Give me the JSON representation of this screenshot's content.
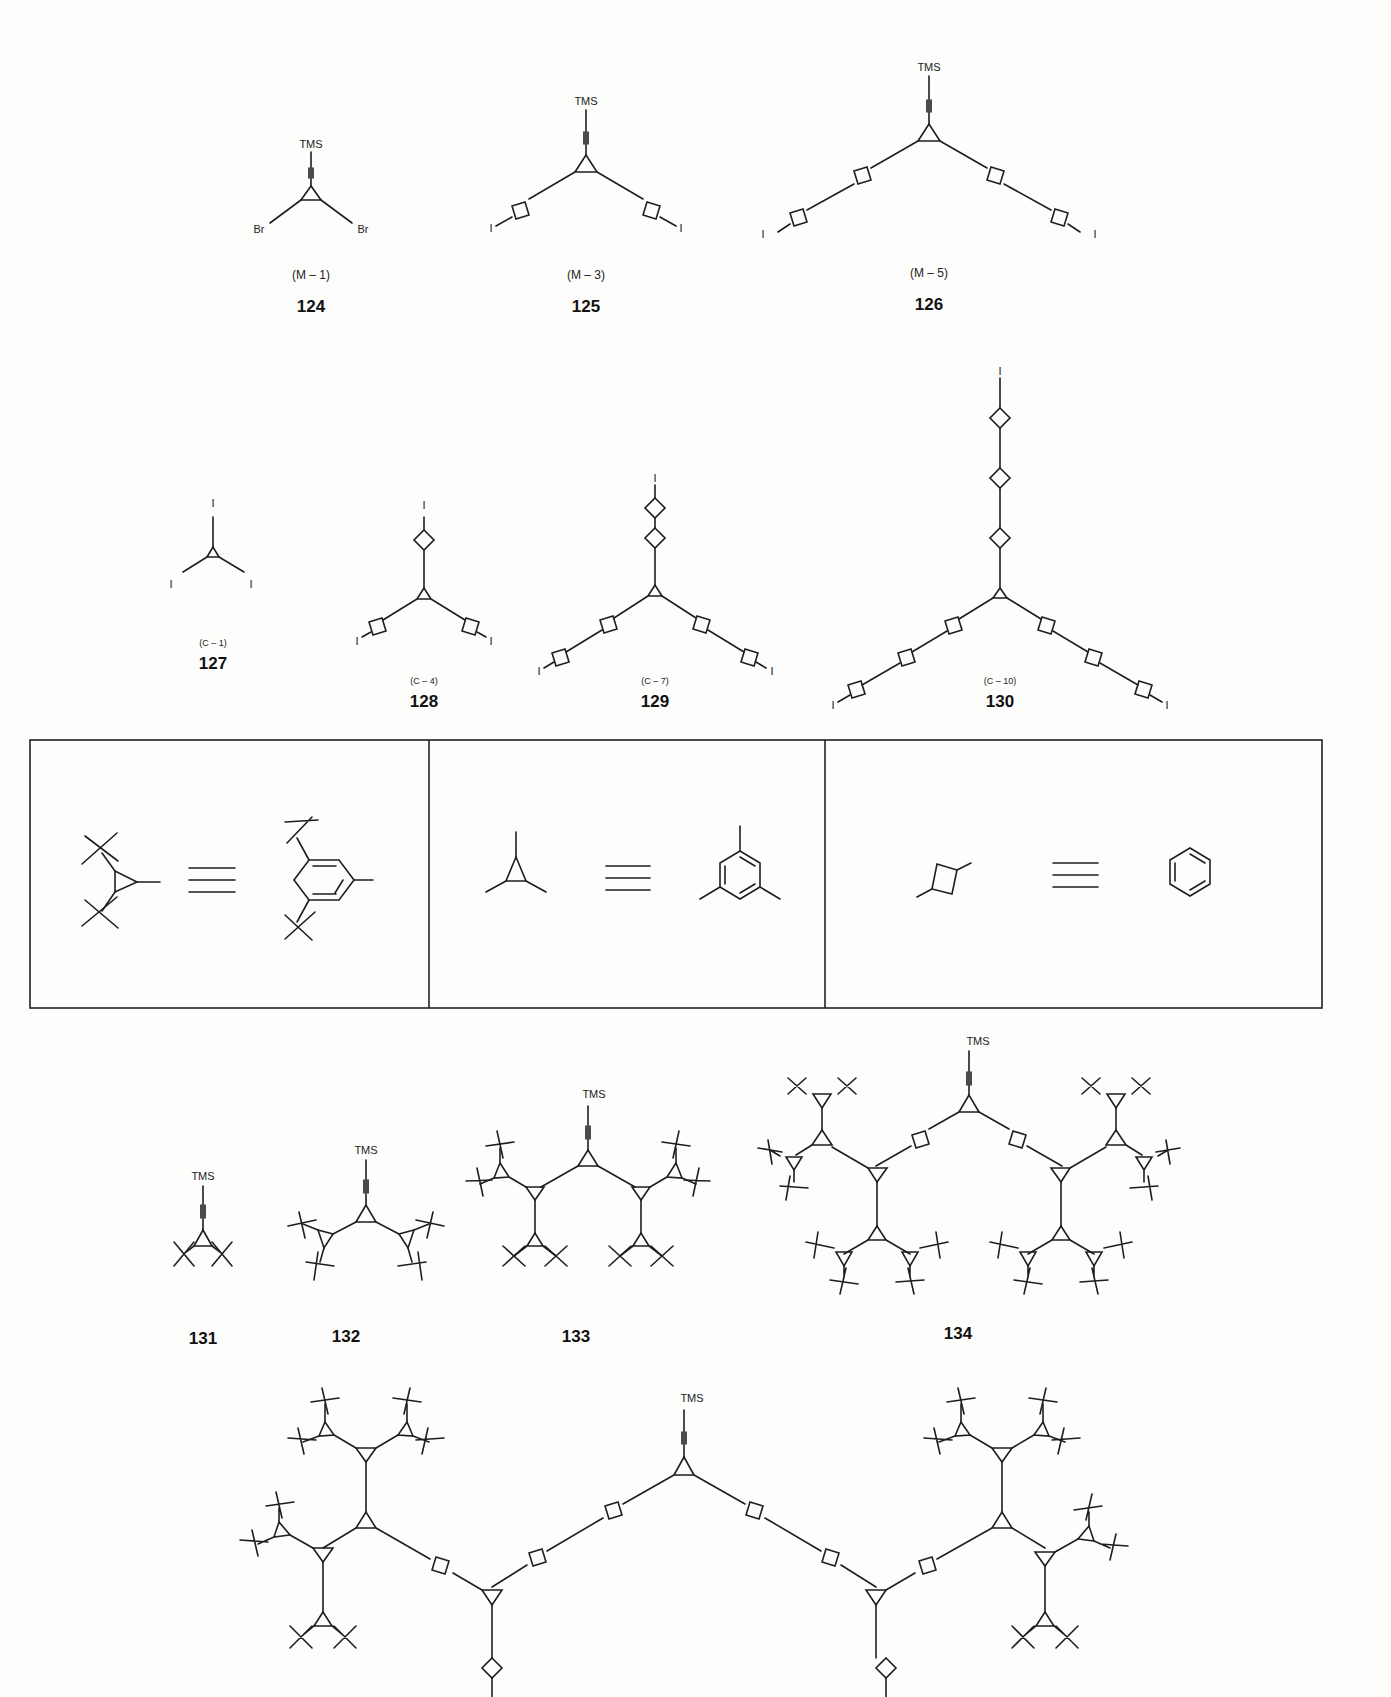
{
  "figure": {
    "rows": [
      {
        "compounds": [
          {
            "number": "124",
            "code": "(M – 1)",
            "terminal": "TMS",
            "substituents": [
              "Br",
              "Br"
            ]
          },
          {
            "number": "125",
            "code": "(M – 3)",
            "terminal": "TMS",
            "substituents": [
              "I",
              "I"
            ]
          },
          {
            "number": "126",
            "code": "(M – 5)",
            "terminal": "TMS",
            "substituents": [
              "I",
              "I"
            ]
          }
        ]
      },
      {
        "compounds": [
          {
            "number": "127",
            "code": "(C – 1)",
            "substituents": [
              "I",
              "I",
              "I"
            ]
          },
          {
            "number": "128",
            "code": "(C – 4)",
            "substituents": [
              "I",
              "I",
              "I"
            ]
          },
          {
            "number": "129",
            "code": "(C – 7)",
            "substituents": [
              "I",
              "I",
              "I"
            ]
          },
          {
            "number": "130",
            "code": "(C – 10)",
            "substituents": [
              "I",
              "I",
              "I"
            ]
          }
        ]
      },
      {
        "legend_panels": [
          {
            "left": "triangle with two tert-butyl groups",
            "symbol": "≡",
            "right": "3,5-di-tert-butylphenyl"
          },
          {
            "left": "triangle (trivalent node)",
            "symbol": "≡",
            "right": "1,3,5-trisubstituted benzene"
          },
          {
            "left": "square (divalent node)",
            "symbol": "≡",
            "right": "benzene (para-linked)"
          }
        ]
      },
      {
        "compounds": [
          {
            "number": "131",
            "terminal": "TMS"
          },
          {
            "number": "132",
            "terminal": "TMS"
          },
          {
            "number": "133",
            "terminal": "TMS"
          },
          {
            "number": "134",
            "terminal": "TMS"
          }
        ]
      },
      {
        "compounds": [
          {
            "number": "",
            "terminal": "TMS"
          }
        ]
      }
    ]
  }
}
